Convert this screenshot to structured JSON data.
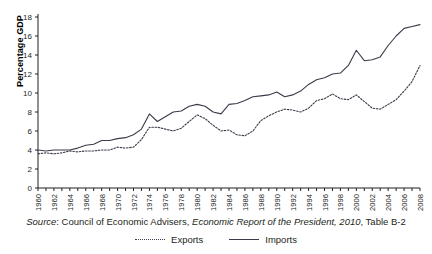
{
  "chart_data": {
    "type": "line",
    "title": "",
    "xlabel": "",
    "ylabel": "Percentage GDP",
    "ylim": [
      0,
      18
    ],
    "ytick_step": 2,
    "yticks": [
      0,
      2,
      4,
      6,
      8,
      10,
      12,
      14,
      16,
      18
    ],
    "xlim": [
      1960,
      2008
    ],
    "xtick_step": 1,
    "xtick_label_step": 2,
    "x": [
      1960,
      1961,
      1962,
      1963,
      1964,
      1965,
      1966,
      1967,
      1968,
      1969,
      1970,
      1971,
      1972,
      1973,
      1974,
      1975,
      1976,
      1977,
      1978,
      1979,
      1980,
      1981,
      1982,
      1983,
      1984,
      1985,
      1986,
      1987,
      1988,
      1989,
      1990,
      1991,
      1992,
      1993,
      1994,
      1995,
      1996,
      1997,
      1998,
      1999,
      2000,
      2001,
      2002,
      2003,
      2004,
      2005,
      2006,
      2007,
      2008
    ],
    "xtick_labels": [
      "1960",
      "1962",
      "1964",
      "1966",
      "1968",
      "1970",
      "1972",
      "1974",
      "1976",
      "1978",
      "1980",
      "1982",
      "1984",
      "1986",
      "1988",
      "1990",
      "1992",
      "1994",
      "1996",
      "1998",
      "2000",
      "2002",
      "2004",
      "2006",
      "2008"
    ],
    "grid": false,
    "legend_position": "below-figure",
    "series": [
      {
        "name": "Exports",
        "style": "dashed",
        "color": "#3b3b4a",
        "values": [
          3.6,
          3.7,
          3.6,
          3.7,
          3.9,
          3.8,
          3.9,
          3.9,
          4.0,
          4.0,
          4.3,
          4.2,
          4.3,
          5.1,
          6.4,
          6.4,
          6.2,
          6.0,
          6.3,
          7.0,
          7.7,
          7.3,
          6.6,
          6.0,
          6.1,
          5.6,
          5.5,
          6.0,
          7.1,
          7.6,
          8.0,
          8.3,
          8.2,
          8.0,
          8.4,
          9.2,
          9.4,
          9.9,
          9.4,
          9.3,
          9.8,
          9.1,
          8.4,
          8.3,
          8.8,
          9.3,
          10.2,
          11.2,
          12.9
        ]
      },
      {
        "name": "Imports",
        "style": "solid",
        "color": "#3b3b4a",
        "values": [
          4.0,
          3.9,
          4.0,
          4.0,
          4.0,
          4.2,
          4.5,
          4.6,
          5.0,
          5.0,
          5.2,
          5.3,
          5.6,
          6.2,
          7.8,
          7.0,
          7.5,
          8.0,
          8.1,
          8.6,
          8.8,
          8.6,
          8.0,
          7.8,
          8.8,
          8.9,
          9.2,
          9.6,
          9.7,
          9.8,
          10.1,
          9.6,
          9.8,
          10.2,
          10.9,
          11.4,
          11.6,
          12.0,
          12.1,
          12.9,
          14.5,
          13.4,
          13.5,
          13.8,
          15.0,
          16.0,
          16.8,
          17.0,
          17.2
        ]
      }
    ],
    "annotations": []
  },
  "source": {
    "prefix_italic": "Source",
    "prefix_rest": ": Council of Economic Advisers, ",
    "publication_italic": "Economic Report of the President, 2010",
    "suffix": ", Table B-2"
  },
  "legend": {
    "entries": [
      {
        "label": "Exports",
        "style": "dashed"
      },
      {
        "label": "Imports",
        "style": "solid"
      }
    ]
  }
}
